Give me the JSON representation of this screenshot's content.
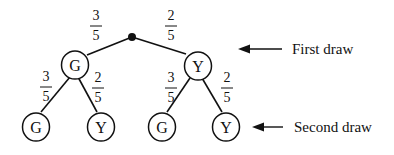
{
  "diagram": {
    "type": "probability-tree",
    "root": {
      "marker": "dot"
    },
    "first_draw": [
      {
        "label": "G",
        "prob_num": "3",
        "prob_den": "5"
      },
      {
        "label": "Y",
        "prob_num": "2",
        "prob_den": "5"
      }
    ],
    "second_draw": [
      {
        "parent": "G",
        "label": "G",
        "prob_num": "3",
        "prob_den": "5"
      },
      {
        "parent": "G",
        "label": "Y",
        "prob_num": "2",
        "prob_den": "5"
      },
      {
        "parent": "Y",
        "label": "G",
        "prob_num": "3",
        "prob_den": "5"
      },
      {
        "parent": "Y",
        "label": "Y",
        "prob_num": "2",
        "prob_den": "5"
      }
    ],
    "annotations": {
      "first": "First draw",
      "second": "Second draw"
    }
  }
}
